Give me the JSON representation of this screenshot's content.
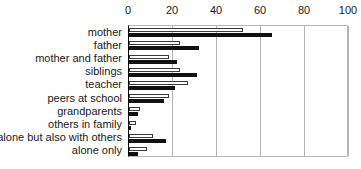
{
  "chart_data": {
    "type": "bar",
    "orientation": "horizontal",
    "title": "",
    "xlabel": "",
    "ylabel": "",
    "xlim": [
      0,
      100
    ],
    "xticks": [
      0,
      20,
      40,
      60,
      80,
      100
    ],
    "grid": true,
    "legend": "none",
    "categories": [
      "mother",
      "father",
      "mother and father",
      "siblings",
      "teacher",
      "peers at school",
      "grandparents",
      "others in family",
      "alone but also with others",
      "alone only"
    ],
    "series": [
      {
        "name": "series-open",
        "style": "open",
        "color": "#ffffff",
        "edge_color": "#3a3a3a",
        "values": [
          52,
          23,
          18,
          23,
          27,
          18,
          5,
          3,
          11,
          8
        ]
      },
      {
        "name": "series-filled",
        "style": "filled",
        "color": "#111111",
        "edge_color": "#111111",
        "values": [
          65,
          32,
          22,
          31,
          21,
          16,
          4,
          1,
          17,
          4
        ]
      }
    ]
  },
  "axis": {
    "tick_labels": [
      "0",
      "20",
      "40",
      "60",
      "80",
      "100"
    ]
  }
}
